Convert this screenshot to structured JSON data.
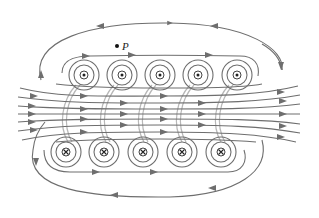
{
  "figure": {
    "line_color": "#6e6e6e",
    "background": "#ffffff",
    "point_label": "P",
    "point_position": {
      "x": 117,
      "y": 46
    },
    "conductors_top": {
      "symbol": "dot",
      "meaning": "current out of page",
      "y": 75,
      "x": [
        84,
        122,
        160,
        198,
        237
      ]
    },
    "conductors_bottom": {
      "symbol": "cross",
      "meaning": "current into page",
      "y": 152,
      "x": [
        66,
        104,
        143,
        182,
        221
      ]
    },
    "field_direction_inside": "left-to-right",
    "return_field": "outer loops return right-to-left above and below"
  }
}
